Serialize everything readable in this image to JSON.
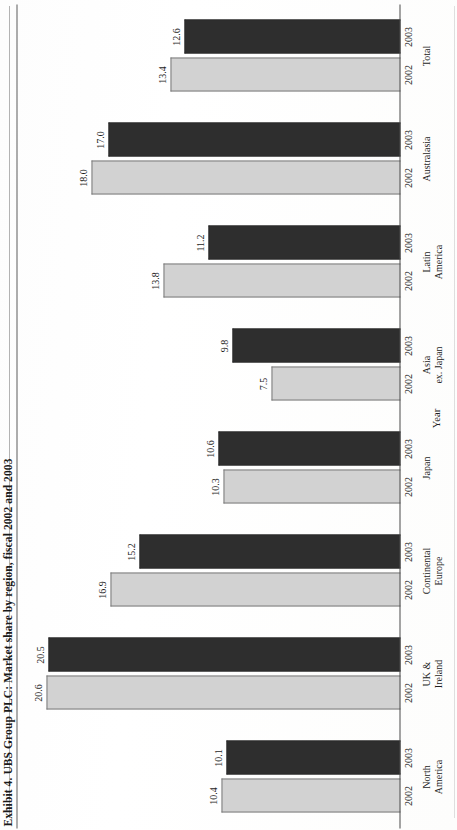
{
  "figure": {
    "caption": "Exhibit 4. UBS Group PLC: Market share by region, fiscal 2002 and 2003",
    "axis_title_x": "Year",
    "colors": {
      "series_2002": "#d2d2d2",
      "series_2003": "#2e2e2e",
      "axis": "#4a4a4a",
      "text": "#1d1d1d",
      "paper": "#fefefe"
    }
  },
  "chart_data": {
    "type": "bar",
    "title": "Exhibit 4. UBS Group PLC: Market share by region, fiscal 2002 and 2003",
    "subtitle": "",
    "orientation": "vertical-grouped",
    "xlabel": "Year",
    "ylabel": "",
    "ylim": [
      0,
      22
    ],
    "grid": false,
    "legend": "none",
    "value_labels_shown": true,
    "categories": [
      "North America",
      "UK & Ireland",
      "Continental Europe",
      "Japan",
      "Asia ex. Japan",
      "Latin America",
      "Australasia",
      "Total"
    ],
    "category_lines": [
      [
        "North",
        "America"
      ],
      [
        "UK &",
        "Ireland"
      ],
      [
        "Continental",
        "Europe"
      ],
      [
        "Japan"
      ],
      [
        "Asia",
        "ex. Japan"
      ],
      [
        "Latin",
        "America"
      ],
      [
        "Australasia"
      ],
      [
        "Total"
      ]
    ],
    "tick_labels": [
      "2002",
      "2003"
    ],
    "series": [
      {
        "name": "2002",
        "color": "#d2d2d2",
        "values": [
          10.4,
          20.6,
          16.9,
          10.3,
          7.5,
          13.8,
          18.0,
          13.4
        ]
      },
      {
        "name": "2003",
        "color": "#2e2e2e",
        "values": [
          10.1,
          20.5,
          15.2,
          10.6,
          9.8,
          11.2,
          17.0,
          12.6
        ]
      }
    ],
    "points": [
      {
        "category": "North America",
        "year": "2002",
        "value": 10.4,
        "label": "10.4"
      },
      {
        "category": "North America",
        "year": "2003",
        "value": 10.1,
        "label": "10.1"
      },
      {
        "category": "UK & Ireland",
        "year": "2002",
        "value": 20.6,
        "label": "20.6"
      },
      {
        "category": "UK & Ireland",
        "year": "2003",
        "value": 20.5,
        "label": "20.5"
      },
      {
        "category": "Continental Europe",
        "year": "2002",
        "value": 16.9,
        "label": "16.9"
      },
      {
        "category": "Continental Europe",
        "year": "2003",
        "value": 15.2,
        "label": "15.2"
      },
      {
        "category": "Japan",
        "year": "2002",
        "value": 10.3,
        "label": "10.3"
      },
      {
        "category": "Japan",
        "year": "2003",
        "value": 10.6,
        "label": "10.6"
      },
      {
        "category": "Asia ex. Japan",
        "year": "2002",
        "value": 7.5,
        "label": "7.5"
      },
      {
        "category": "Asia ex. Japan",
        "year": "2003",
        "value": 9.8,
        "label": "9.8"
      },
      {
        "category": "Latin America",
        "year": "2002",
        "value": 13.8,
        "label": "13.8"
      },
      {
        "category": "Latin America",
        "year": "2003",
        "value": 11.2,
        "label": "11.2"
      },
      {
        "category": "Australasia",
        "year": "2002",
        "value": 18.0,
        "label": "18.0"
      },
      {
        "category": "Australasia",
        "year": "2003",
        "value": 17.0,
        "label": "17.0"
      },
      {
        "category": "Total",
        "year": "2002",
        "value": 13.4,
        "label": "13.4"
      },
      {
        "category": "Total",
        "year": "2003",
        "value": 12.6,
        "label": "12.6"
      }
    ]
  }
}
